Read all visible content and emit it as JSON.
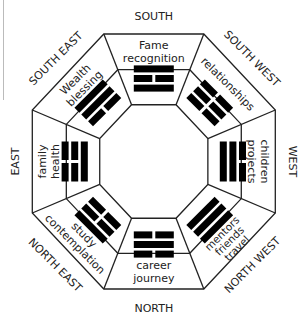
{
  "diagram": {
    "type": "bagua-map",
    "center": [
      154,
      161.5
    ],
    "colors": {
      "line": "#222222",
      "trigram": "#000000",
      "background": "#ffffff",
      "left_rule": "#bbbbbb"
    }
  },
  "directions": {
    "south": "SOUTH",
    "south_west": "SOUTH WEST",
    "west": "WEST",
    "north_west": "NORTH WEST",
    "north": "NORTH",
    "north_east": "NORTH EAST",
    "east": "EAST",
    "south_east": "SOUTH EAST"
  },
  "areas": {
    "south": [
      "Fame",
      "recognition"
    ],
    "south_west": [
      "relationships"
    ],
    "west": [
      "children",
      "projects"
    ],
    "north_west": [
      "mentors",
      "friends",
      "travel"
    ],
    "north": [
      "career",
      "journey"
    ],
    "north_east": [
      "study",
      "contemplation"
    ],
    "east": [
      "family",
      "health"
    ],
    "south_east": [
      "Wealth",
      "blessing"
    ]
  },
  "trigrams": {
    "south": {
      "name": "Li",
      "lines_outer_to_inner": [
        "solid",
        "broken",
        "solid"
      ]
    },
    "south_west": {
      "name": "Kun",
      "lines_outer_to_inner": [
        "broken",
        "broken",
        "broken"
      ]
    },
    "west": {
      "name": "Dui",
      "lines_outer_to_inner": [
        "broken",
        "solid",
        "solid"
      ]
    },
    "north_west": {
      "name": "Qian",
      "lines_outer_to_inner": [
        "solid",
        "solid",
        "solid"
      ]
    },
    "north": {
      "name": "Kan",
      "lines_outer_to_inner": [
        "broken",
        "solid",
        "broken"
      ]
    },
    "north_east": {
      "name": "Gen",
      "lines_outer_to_inner": [
        "solid",
        "broken",
        "broken"
      ]
    },
    "east": {
      "name": "Zhen",
      "lines_outer_to_inner": [
        "broken",
        "broken",
        "solid"
      ]
    },
    "south_east": {
      "name": "Xun",
      "lines_outer_to_inner": [
        "solid",
        "solid",
        "broken"
      ]
    }
  }
}
